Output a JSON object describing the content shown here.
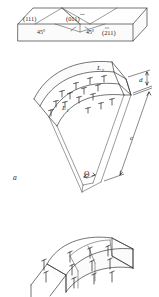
{
  "figure": {
    "panel_label": "a",
    "panels": [
      {
        "name": "slab-with-miller-indices",
        "description": "rectangular crystal slab showing trace planes",
        "labels": [
          {
            "id": "plane_111",
            "text": "(111)"
          },
          {
            "id": "plane_01-1",
            "text": "(011)",
            "overbar_on": "last"
          },
          {
            "id": "plane_-211",
            "text": "(211)",
            "overbar_on": "first"
          },
          {
            "id": "angle_left",
            "text": "45°"
          },
          {
            "id": "angle_right",
            "text": "45°"
          }
        ]
      },
      {
        "name": "bent-wedge-crystal",
        "description": "curved wedge shaped crystal with dislocation array on top face",
        "labels": [
          {
            "id": "arc_outer",
            "text": "L",
            "sub": "2"
          },
          {
            "id": "arc_inner",
            "text": "L",
            "sub": "1"
          },
          {
            "id": "thickness",
            "text": "d"
          },
          {
            "id": "length",
            "text": "c"
          },
          {
            "id": "wedge_angle",
            "text": "Θ"
          }
        ],
        "dislocation_rows": [
          {
            "row": 1,
            "count": 4
          },
          {
            "row": 2,
            "count": 4
          },
          {
            "row": 3,
            "count": 4
          },
          {
            "row": 4,
            "count": 3
          }
        ]
      },
      {
        "name": "segmented-bent-bar",
        "description": "segmented curved bar with dislocation arrows at segment boundaries",
        "segments": 4,
        "arrow_columns": [
          {
            "column": 1,
            "count": 2
          },
          {
            "column": 2,
            "count": 3
          },
          {
            "column": 3,
            "count": 3
          },
          {
            "column": 4,
            "count": 3
          }
        ]
      }
    ],
    "colors": {
      "stroke": "#3a3a3a",
      "text": "#1a1a1a",
      "background": "#ffffff"
    }
  }
}
